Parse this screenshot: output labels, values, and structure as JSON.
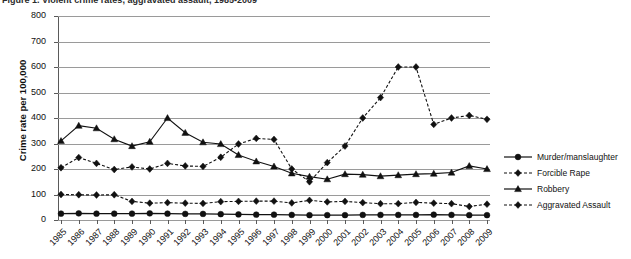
{
  "caption": {
    "text": "Figure 1. Violent crime rates, aggravated assault, 1985-2009"
  },
  "chart_data": {
    "type": "line",
    "title": "",
    "xlabel": "",
    "ylabel": "Crime rate per 100,000",
    "ylim": [
      0,
      800
    ],
    "ytick_step": 100,
    "yticks": [
      "800",
      "700",
      "600",
      "500",
      "400",
      "300",
      "200",
      "100",
      "0"
    ],
    "grid": true,
    "legend_position": "right",
    "categories": [
      "1985",
      "1986",
      "1987",
      "1988",
      "1989",
      "1990",
      "1991",
      "1992",
      "1993",
      "1994",
      "1995",
      "1996",
      "1997",
      "1998",
      "1999",
      "2000",
      "2001",
      "2002",
      "2003",
      "2004",
      "2005",
      "2006",
      "2007",
      "2008",
      "2009"
    ],
    "series": [
      {
        "name": "Murder/manslaughter",
        "marker": "circle",
        "dash": "solid",
        "color": "#111111",
        "values": [
          25,
          26,
          25,
          25,
          25,
          26,
          25,
          24,
          24,
          23,
          22,
          21,
          21,
          20,
          19,
          19,
          19,
          20,
          20,
          20,
          20,
          21,
          20,
          19,
          19
        ]
      },
      {
        "name": "Forcible Rape",
        "marker": "diamond",
        "dash": "dashed",
        "color": "#111111",
        "values": [
          100,
          99,
          98,
          99,
          73,
          66,
          68,
          66,
          65,
          72,
          73,
          74,
          74,
          67,
          77,
          71,
          73,
          68,
          64,
          64,
          69,
          66,
          64,
          53,
          62
        ]
      },
      {
        "name": "Robbery",
        "marker": "triangle",
        "dash": "solid",
        "color": "#111111",
        "values": [
          310,
          370,
          360,
          317,
          290,
          307,
          400,
          342,
          305,
          298,
          255,
          230,
          210,
          183,
          170,
          160,
          180,
          178,
          172,
          176,
          180,
          182,
          186,
          212,
          200
        ]
      },
      {
        "name": "Aggravated Assault",
        "marker": "diamond",
        "dash": "dashed",
        "color": "#111111",
        "values": [
          205,
          245,
          222,
          198,
          208,
          200,
          222,
          212,
          210,
          246,
          298,
          320,
          316,
          200,
          150,
          225,
          290,
          400,
          480,
          600,
          600,
          375,
          400,
          410,
          395
        ]
      }
    ]
  },
  "legend": {
    "items": [
      {
        "label": "Murder/manslaughter",
        "marker": "circle",
        "dash": "solid"
      },
      {
        "label": "Forcible Rape",
        "marker": "diamond",
        "dash": "dashed"
      },
      {
        "label": "Robbery",
        "marker": "triangle",
        "dash": "solid"
      },
      {
        "label": "Aggravated Assault",
        "marker": "diamond",
        "dash": "dashed"
      }
    ]
  }
}
